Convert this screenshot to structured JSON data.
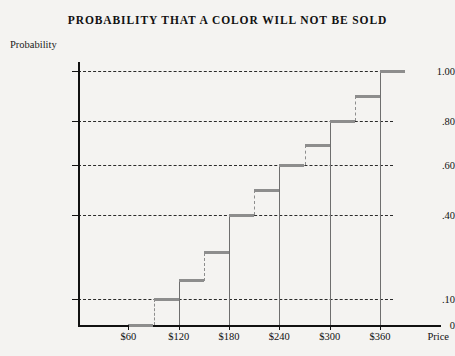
{
  "chart_data": {
    "type": "line",
    "subtype": "step-cdf",
    "title": "PROBABILITY THAT A COLOR WILL NOT BE SOLD",
    "xlabel": "Price",
    "ylabel": "Probability",
    "grid": true,
    "legend": "none",
    "xlim": [
      0,
      420
    ],
    "ylim": [
      0,
      1.0
    ],
    "x_tick_labels": [
      "$60",
      "$120",
      "$180",
      "$240",
      "$300",
      "$360"
    ],
    "x_tick_values": [
      60,
      120,
      180,
      240,
      300,
      360
    ],
    "y_tick_labels": [
      "0",
      ".10",
      ".40",
      ".60",
      ".80",
      "1.00"
    ],
    "y_tick_values": [
      0,
      0.1,
      0.4,
      0.6,
      0.8,
      1.0
    ],
    "x": [
      60,
      90,
      120,
      150,
      180,
      210,
      240,
      270,
      300,
      330,
      360
    ],
    "values": [
      0.0,
      0.1,
      0.165,
      0.265,
      0.4,
      0.5,
      0.6,
      0.69,
      0.8,
      0.9,
      1.0
    ],
    "steps": [
      {
        "x_start": 60,
        "x_end": 90,
        "y": 0.0
      },
      {
        "x_start": 90,
        "x_end": 120,
        "y": 0.1
      },
      {
        "x_start": 120,
        "x_end": 150,
        "y": 0.165
      },
      {
        "x_start": 150,
        "x_end": 180,
        "y": 0.265
      },
      {
        "x_start": 180,
        "x_end": 210,
        "y": 0.4
      },
      {
        "x_start": 210,
        "x_end": 240,
        "y": 0.5
      },
      {
        "x_start": 240,
        "x_end": 270,
        "y": 0.6
      },
      {
        "x_start": 270,
        "x_end": 300,
        "y": 0.69
      },
      {
        "x_start": 300,
        "x_end": 330,
        "y": 0.8
      },
      {
        "x_start": 330,
        "x_end": 360,
        "y": 0.9
      },
      {
        "x_start": 360,
        "x_end": 390,
        "y": 1.0
      }
    ],
    "colors": {
      "tread": "#8d8d8d",
      "riser": "#6e6e6e",
      "axis": "#111111",
      "grid": "#2a2a2a",
      "background": "#f4f3f1"
    }
  }
}
